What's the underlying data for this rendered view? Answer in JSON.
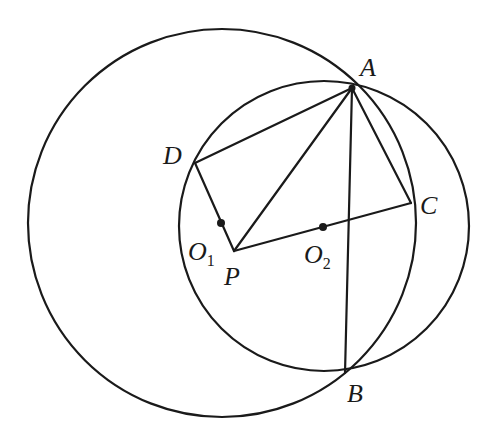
{
  "diagram": {
    "type": "geometry",
    "stroke_color": "#1a1a1a",
    "background": "#ffffff",
    "circles": [
      {
        "name": "circle-O1",
        "cx": 222,
        "cy": 223,
        "r": 194
      },
      {
        "name": "circle-O2",
        "cx": 324,
        "cy": 226,
        "r": 145
      }
    ],
    "points": {
      "A": {
        "label": "A",
        "x": 352,
        "y": 88
      },
      "B": {
        "label": "B",
        "x": 345,
        "y": 373
      },
      "C": {
        "label": "C",
        "x": 411,
        "y": 203
      },
      "D": {
        "label": "D",
        "x": 195,
        "y": 163
      },
      "P": {
        "label": "P",
        "x": 234,
        "y": 251
      },
      "O1": {
        "label": "O",
        "subscript": "1",
        "x": 221,
        "y": 223
      },
      "O2": {
        "label": "O",
        "subscript": "2",
        "x": 323,
        "y": 227
      }
    },
    "segments": [
      [
        "D",
        "A"
      ],
      [
        "A",
        "P"
      ],
      [
        "A",
        "C"
      ],
      [
        "A",
        "B"
      ],
      [
        "D",
        "P"
      ],
      [
        "P",
        "C"
      ]
    ]
  }
}
